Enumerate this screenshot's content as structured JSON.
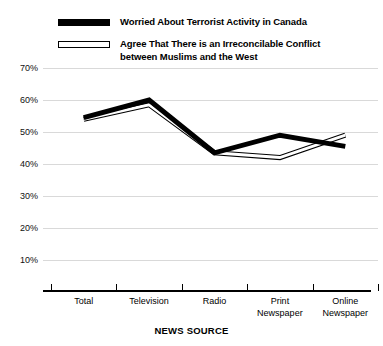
{
  "legend": {
    "entries": [
      {
        "label": "Worried About Terrorist Activity in Canada",
        "style": "solid-thick-black",
        "swatch": "legend-swatch-solid"
      },
      {
        "label": "Agree That There is an Irreconcilable Conflict\nbetween Muslims and the West",
        "style": "hollow-outline",
        "swatch": "legend-swatch-hollow"
      }
    ]
  },
  "axes": {
    "x_title": "NEWS SOURCE",
    "y_tick_labels": [
      "70%",
      "60%",
      "50%",
      "40%",
      "30%",
      "20%",
      "10%"
    ],
    "x_tick_labels": [
      "Total",
      "Television",
      "Radio",
      "Print\nNewspaper",
      "Online\nNewspaper"
    ]
  },
  "colors": {
    "series_worried": "#000000",
    "series_conflict_stroke": "#000000",
    "series_conflict_fill": "#ffffff",
    "gridline": "#d9d9d9",
    "axis": "#000000",
    "background": "#ffffff"
  },
  "chart_data": {
    "type": "line",
    "title": "",
    "xlabel": "NEWS SOURCE",
    "ylabel": "",
    "categories": [
      "Total",
      "Television",
      "Radio",
      "Print Newspaper",
      "Online Newspaper"
    ],
    "series": [
      {
        "name": "Worried About Terrorist Activity in Canada",
        "values": [
          54.5,
          60,
          43.5,
          49,
          45.5
        ],
        "line_style": "thick-solid-black",
        "line_width_px": 5
      },
      {
        "name": "Agree That There is an Irreconcilable Conflict between Muslims and the West",
        "values": [
          54,
          58.5,
          43.5,
          42,
          49
        ],
        "line_style": "thin-hollow-outline",
        "line_width_px": 1
      }
    ],
    "ylim": [
      0,
      70
    ],
    "ytick_values": [
      70,
      60,
      50,
      40,
      30,
      20,
      10
    ],
    "ytick_format": "percent",
    "grid": "horizontal",
    "legend_position": "top-left"
  }
}
